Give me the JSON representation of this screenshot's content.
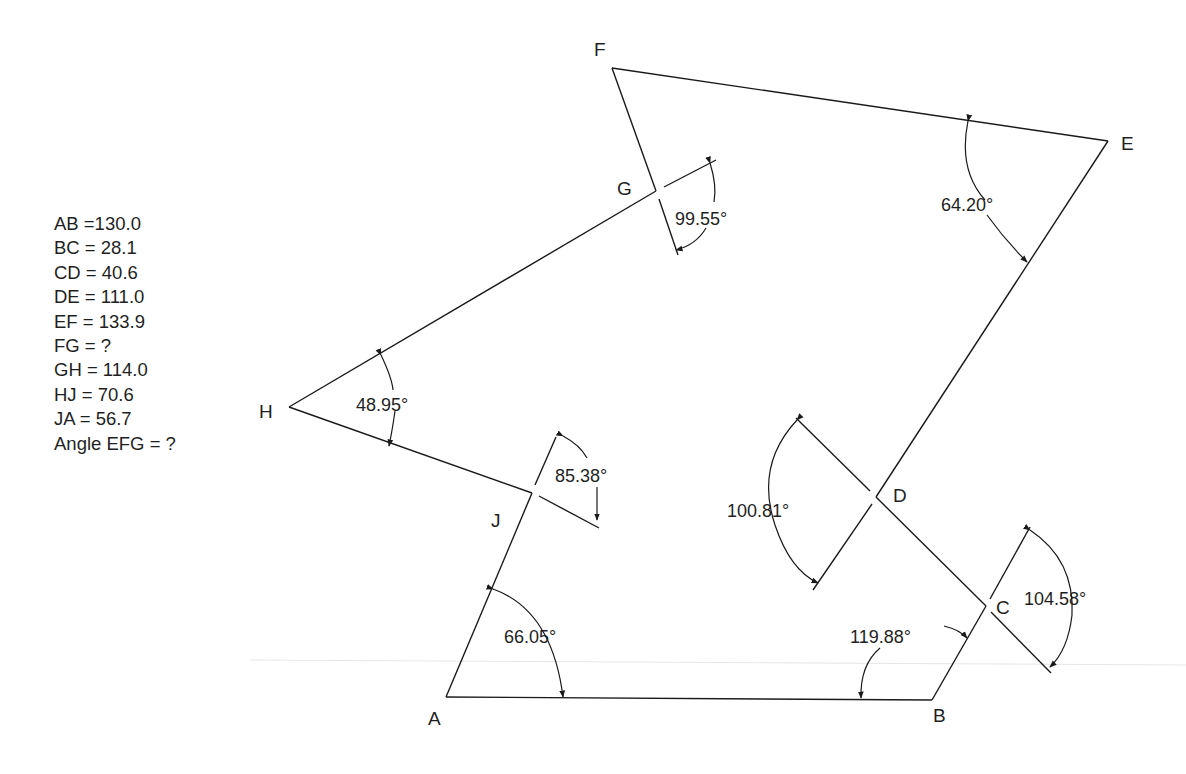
{
  "given": {
    "lines": [
      "AB =130.0",
      "BC = 28.1",
      "CD = 40.6",
      "DE = 111.0",
      "EF = 133.9",
      "FG = ?",
      "GH = 114.0",
      "HJ = 70.6",
      "JA = 56.7",
      "Angle EFG = ?"
    ]
  },
  "vertices": {
    "A": "A",
    "B": "B",
    "C": "C",
    "D": "D",
    "E": "E",
    "F": "F",
    "G": "G",
    "H": "H",
    "J": "J"
  },
  "angles": {
    "A": "66.05°",
    "B": "119.88°",
    "C": "104.58°",
    "D": "100.81°",
    "E": "64.20°",
    "G": "99.55°",
    "H": "48.95°",
    "J": "85.38°"
  },
  "colors": {
    "line": "#1a1a1a",
    "text": "#1f1f1f",
    "background": "#ffffff"
  }
}
